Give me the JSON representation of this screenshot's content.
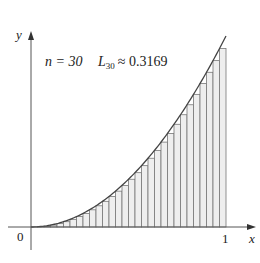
{
  "chart_data": {
    "type": "area",
    "title": "",
    "annotation": {
      "n_label": "n = 30",
      "L_symbol": "L",
      "L_subscript": "30",
      "approx": "≈ 0.3169"
    },
    "function": "y = x^2",
    "method": "left-endpoint Riemann sum",
    "n": 30,
    "approximation": 0.3169,
    "xlabel": "x",
    "ylabel": "y",
    "x_ticks": [
      "0",
      "1"
    ],
    "xlim": [
      0,
      1
    ],
    "ylim": [
      0,
      1
    ],
    "grid": false,
    "colors": {
      "curve": "#444444",
      "rect_fill": "#eeeeee",
      "rect_stroke": "#777777",
      "axis": "#555555"
    }
  },
  "labels": {
    "origin": "0",
    "x_one": "1",
    "x_axis": "x",
    "y_axis": "y",
    "n_text": "n = 30",
    "L": "L",
    "L_sub": "30",
    "approx_text": "≈ 0.3169"
  }
}
